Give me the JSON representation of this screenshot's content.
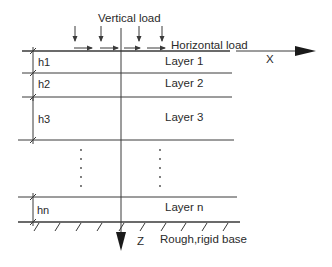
{
  "diagram": {
    "labels": {
      "vertical_load": "Vertical load",
      "horizontal_load": "Horizontal load",
      "x_axis": "X",
      "z_axis": "Z",
      "base": "Rough,rigid base"
    },
    "layers": [
      {
        "name": "Layer 1",
        "thickness": "h1"
      },
      {
        "name": "Layer 2",
        "thickness": "h2"
      },
      {
        "name": "Layer 3",
        "thickness": "h3"
      },
      {
        "name": "Layer n",
        "thickness": "hn"
      }
    ],
    "ellipsis": "⋮",
    "colors": {
      "line": "#3a3a3a",
      "text": "#2a2a2a",
      "background": "#ffffff"
    }
  }
}
